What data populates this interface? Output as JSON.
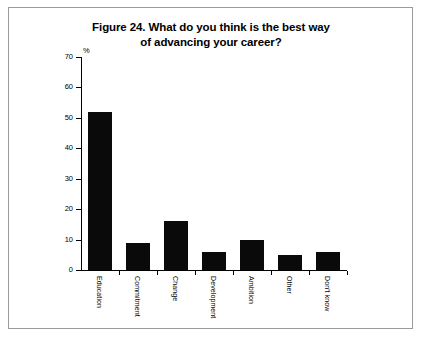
{
  "figure": {
    "title": "Figure 24. What do you think is the best way of advancing your career?",
    "title_line1": "Figure 24. What do you think is the best way",
    "title_line2": "of advancing your career?",
    "axis_unit_label": "%",
    "border_color": "#9a9a9a",
    "bar_color": "#0a0a0a",
    "background_color": "#ffffff"
  },
  "chart_data": {
    "type": "bar",
    "title": "Figure 24. What do you think is the best way of advancing your career?",
    "xlabel": "",
    "ylabel": "%",
    "ylim": [
      0,
      70
    ],
    "yticks": [
      0,
      10,
      20,
      30,
      40,
      50,
      60,
      70
    ],
    "ytick_labels": [
      "0",
      "10",
      "20",
      "30",
      "40",
      "50",
      "60",
      "70"
    ],
    "grid": false,
    "legend": null,
    "categories": [
      "Education",
      "Commitment",
      "Change",
      "Development",
      "Ambition",
      "Other",
      "Don't know"
    ],
    "values": [
      52,
      9,
      16,
      6,
      10,
      5,
      6
    ]
  }
}
